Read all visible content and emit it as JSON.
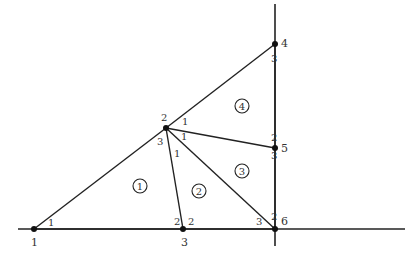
{
  "diagram": {
    "type": "triangulated-mesh",
    "stroke_color": "#222222",
    "nodes": [
      {
        "id": "1",
        "label": "1",
        "x": 34,
        "y": 229
      },
      {
        "id": "2",
        "label": "2",
        "x": 166,
        "y": 128
      },
      {
        "id": "3",
        "label": "3",
        "x": 183,
        "y": 229
      },
      {
        "id": "4",
        "label": "4",
        "x": 275,
        "y": 44
      },
      {
        "id": "5",
        "label": "5",
        "x": 275,
        "y": 148
      },
      {
        "id": "6",
        "label": "6",
        "x": 275,
        "y": 229
      }
    ],
    "elements": [
      {
        "id": "1",
        "label": "1",
        "nodes": [
          "1",
          "3",
          "2"
        ],
        "local_labels": [
          "1",
          "2",
          "3"
        ]
      },
      {
        "id": "2",
        "label": "2",
        "nodes": [
          "2",
          "3",
          "6"
        ],
        "local_labels": [
          "1",
          "2",
          "3"
        ]
      },
      {
        "id": "3",
        "label": "3",
        "nodes": [
          "2",
          "6",
          "5"
        ],
        "local_labels": [
          "1",
          "2",
          "3"
        ]
      },
      {
        "id": "4",
        "label": "4",
        "nodes": [
          "2",
          "5",
          "4"
        ],
        "local_labels": [
          "1",
          "2",
          "3"
        ]
      }
    ],
    "corner_labels": [
      {
        "text": "1",
        "x": 48,
        "y": 226
      },
      {
        "text": "2",
        "x": 161,
        "y": 121
      },
      {
        "text": "3",
        "x": 157,
        "y": 145
      },
      {
        "text": "1",
        "x": 174,
        "y": 157
      },
      {
        "text": "1",
        "x": 181,
        "y": 140
      },
      {
        "text": "1",
        "x": 182,
        "y": 125
      },
      {
        "text": "2",
        "x": 174,
        "y": 225
      },
      {
        "text": "2",
        "x": 188,
        "y": 225
      },
      {
        "text": "3",
        "x": 256,
        "y": 225
      },
      {
        "text": "2",
        "x": 271,
        "y": 220
      },
      {
        "text": "3",
        "x": 271,
        "y": 159
      },
      {
        "text": "2",
        "x": 271,
        "y": 141
      },
      {
        "text": "3",
        "x": 271,
        "y": 62
      }
    ],
    "node_labels": [
      {
        "text": "1",
        "x": 31,
        "y": 246
      },
      {
        "text": "3",
        "x": 181,
        "y": 246
      },
      {
        "text": "4",
        "x": 281,
        "y": 47
      },
      {
        "text": "5",
        "x": 281,
        "y": 152
      },
      {
        "text": "6",
        "x": 281,
        "y": 225
      }
    ],
    "element_labels": [
      {
        "text": "1",
        "x": 140,
        "y": 186
      },
      {
        "text": "2",
        "x": 199,
        "y": 191
      },
      {
        "text": "3",
        "x": 242,
        "y": 171
      },
      {
        "text": "4",
        "x": 242,
        "y": 106
      }
    ],
    "axes": {
      "horizontal": {
        "x1": 18,
        "y1": 229,
        "x2": 405,
        "y2": 229
      },
      "vertical": {
        "x1": 275,
        "y1": 4,
        "x2": 275,
        "y2": 246
      }
    }
  }
}
